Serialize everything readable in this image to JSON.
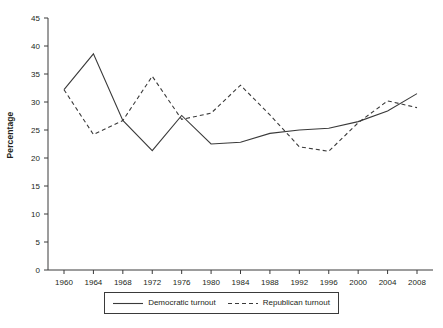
{
  "chart_data": {
    "type": "line",
    "title": "",
    "xlabel": "",
    "ylabel": "Percentage",
    "xlim": [
      1960,
      2008
    ],
    "ylim": [
      0,
      45
    ],
    "yticks": [
      0,
      5,
      10,
      15,
      20,
      25,
      30,
      35,
      40,
      45
    ],
    "grid": false,
    "legend_position": "bottom",
    "x": [
      1960,
      1964,
      1968,
      1972,
      1976,
      1980,
      1984,
      1988,
      1992,
      1996,
      2000,
      2004,
      2008
    ],
    "categories": [
      "1960",
      "1964",
      "1968",
      "1972",
      "1976",
      "1980",
      "1984",
      "1988",
      "1992",
      "1996",
      "2000",
      "2004",
      "2008"
    ],
    "series": [
      {
        "name": "Democratic turnout",
        "style": "solid",
        "color": "#3a3a3a",
        "values": [
          32.2,
          38.6,
          26.7,
          21.3,
          27.6,
          22.5,
          22.8,
          24.4,
          25.0,
          25.3,
          26.5,
          28.4,
          31.5
        ]
      },
      {
        "name": "Republican turnout",
        "style": "dashed",
        "color": "#3a3a3a",
        "values": [
          32.2,
          24.2,
          26.7,
          34.6,
          26.9,
          28.0,
          33.0,
          27.7,
          22.0,
          21.2,
          26.3,
          30.2,
          29.0
        ]
      }
    ]
  },
  "axes": {
    "y_label": "Percentage",
    "y_tick_labels": [
      "45",
      "40",
      "35",
      "30",
      "25",
      "20",
      "15",
      "10",
      "5",
      "0"
    ],
    "x_tick_labels": [
      "1960",
      "1964",
      "1968",
      "1972",
      "1976",
      "1980",
      "1984",
      "1988",
      "1992",
      "1996",
      "2000",
      "2004",
      "2008"
    ]
  },
  "legend": {
    "items": [
      {
        "label": "Democratic turnout",
        "style": "solid"
      },
      {
        "label": "Republican turnout",
        "style": "dashed"
      }
    ]
  },
  "colors": {
    "axis": "#3a3a3a",
    "line": "#3a3a3a",
    "text": "#231f20",
    "background": "#ffffff"
  }
}
